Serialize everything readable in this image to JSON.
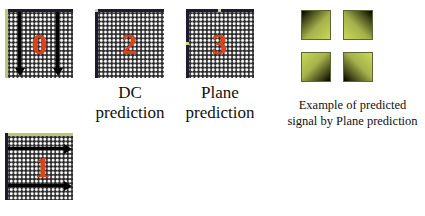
{
  "modes": [
    {
      "number": "0",
      "name": "vertical",
      "label": ""
    },
    {
      "number": "2",
      "name": "dc",
      "label_line1": "DC",
      "label_line2": "prediction"
    },
    {
      "number": "3",
      "name": "plane",
      "label_line1": "Plane",
      "label_line2": "prediction"
    },
    {
      "number": "1",
      "name": "horizontal",
      "label": ""
    }
  ],
  "example": {
    "caption_line1": "Example of predicted",
    "caption_line2": "signal by Plane prediction",
    "squares": [
      {
        "position": "top-left",
        "dark_corner": "top-left"
      },
      {
        "position": "top-right",
        "dark_corner": "top-right"
      },
      {
        "position": "bottom-left",
        "dark_corner": "bottom-right"
      },
      {
        "position": "bottom-right",
        "dark_corner": "bottom-left"
      }
    ]
  },
  "colors": {
    "mode_number": "#d9431e",
    "reference_pixels": "#b9c873",
    "predicted_light": "#c8d85a",
    "predicted_dark": "#000000",
    "arrow": "#000000"
  }
}
